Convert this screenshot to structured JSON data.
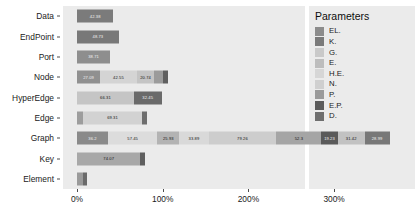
{
  "chart_data": {
    "type": "bar",
    "orientation": "horizontal",
    "stacked": true,
    "title": "",
    "xlabel": "",
    "ylabel": "",
    "xlim": [
      0,
      360
    ],
    "xticks": [
      0,
      100,
      200,
      300
    ],
    "xtick_labels": [
      "0%",
      "100%",
      "200%",
      "300%"
    ],
    "grid": false,
    "legend_position": "right",
    "legend_title": "Parameters",
    "categories": [
      "Data",
      "EndPoint",
      "Port",
      "Node",
      "HyperEdge",
      "Edge",
      "Graph",
      "Key",
      "Element"
    ],
    "series": [
      {
        "name": "EL.",
        "color": "#8c8c8c"
      },
      {
        "name": "K.",
        "color": "#7a7a7a"
      },
      {
        "name": "G.",
        "color": "#c9c9c9"
      },
      {
        "name": "E.",
        "color": "#bdbdbd"
      },
      {
        "name": "H.E.",
        "color": "#d6d6d6"
      },
      {
        "name": "N.",
        "color": "#cfcfcf"
      },
      {
        "name": "P.",
        "color": "#9a9a9a"
      },
      {
        "name": "E.P.",
        "color": "#5c5c5c"
      },
      {
        "name": "D.",
        "color": "#6e6e6e"
      }
    ],
    "rows": [
      {
        "category": "Data",
        "segments": [
          {
            "series": "K.",
            "value": 42.38,
            "label": "42.38",
            "color": "#7b7b7b",
            "label_color": "light"
          }
        ]
      },
      {
        "category": "EndPoint",
        "segments": [
          {
            "series": "K.",
            "value": 48.73,
            "label": "48.73",
            "color": "#787878",
            "label_color": "light"
          }
        ]
      },
      {
        "category": "Port",
        "segments": [
          {
            "series": "P.",
            "value": 38.71,
            "label": "38.71",
            "color": "#8e8e8e",
            "label_color": "light"
          }
        ]
      },
      {
        "category": "Node",
        "segments": [
          {
            "series": "EL.",
            "value": 27.09,
            "label": "27.09",
            "color": "#909090",
            "label_color": "light"
          },
          {
            "series": "H.E.",
            "value": 42.55,
            "label": "42.55",
            "color": "#d4d4d4",
            "label_color": "dark"
          },
          {
            "series": "N.",
            "value": 20.74,
            "label": "20.74",
            "color": "#c4c4c4",
            "label_color": "dark"
          },
          {
            "series": "P.",
            "value": 10.2,
            "label": "",
            "color": "#9b9b9b",
            "label_color": "light"
          },
          {
            "series": "E.P.",
            "value": 5.4,
            "label": "",
            "color": "#5f5f5f",
            "label_color": "light"
          }
        ]
      },
      {
        "category": "HyperEdge",
        "segments": [
          {
            "series": "H.E.",
            "value": 66.31,
            "label": "66.31",
            "color": "#c5c5c5",
            "label_color": "dark"
          },
          {
            "series": "E.P.",
            "value": 32.45,
            "label": "32.45",
            "color": "#6a6a6a",
            "label_color": "light"
          }
        ]
      },
      {
        "category": "Edge",
        "segments": [
          {
            "series": "EL.",
            "value": 6.8,
            "label": "",
            "color": "#9d9d9d",
            "label_color": "light"
          },
          {
            "series": "E.",
            "value": 69.31,
            "label": "69.31",
            "color": "#d2d2d2",
            "label_color": "dark"
          },
          {
            "series": "E.P.",
            "value": 5.6,
            "label": "",
            "color": "#6e6e6e",
            "label_color": "light"
          }
        ]
      },
      {
        "category": "Graph",
        "segments": [
          {
            "series": "EL.",
            "value": 36.2,
            "label": "36.2",
            "color": "#8a8a8a",
            "label_color": "light"
          },
          {
            "series": "G.",
            "value": 57.45,
            "label": "57.45",
            "color": "#dcdcdc",
            "label_color": "dark"
          },
          {
            "series": "E.",
            "value": 25.93,
            "label": "25.93",
            "color": "#b3b3b3",
            "label_color": "dark"
          },
          {
            "series": "H.E.",
            "value": 33.89,
            "label": "33.89",
            "color": "#d9d9d9",
            "label_color": "dark"
          },
          {
            "series": "N.",
            "value": 79.26,
            "label": "79.26",
            "color": "#cdcdcd",
            "label_color": "dark"
          },
          {
            "series": "P.",
            "value": 52.3,
            "label": "52.3",
            "color": "#a5a5a5",
            "label_color": "dark"
          },
          {
            "series": "E.P.",
            "value": 19.23,
            "label": "19.23",
            "color": "#5a5a5a",
            "label_color": "light"
          },
          {
            "series": "D.",
            "value": 31.42,
            "label": "31.42",
            "color": "#c2c2c2",
            "label_color": "dark"
          },
          {
            "series": "K.",
            "value": 28.99,
            "label": "28.99",
            "color": "#787878",
            "label_color": "light"
          }
        ]
      },
      {
        "category": "Key",
        "segments": [
          {
            "series": "K.",
            "value": 74.07,
            "label": "74.07",
            "color": "#a8a8a8",
            "label_color": "dark"
          },
          {
            "series": "E.P.",
            "value": 5.6,
            "label": "",
            "color": "#5f5f5f",
            "label_color": "light"
          }
        ]
      },
      {
        "category": "Element",
        "segments": [
          {
            "series": "EL.",
            "value": 7.2,
            "label": "",
            "color": "#9a9a9a",
            "label_color": "light"
          },
          {
            "series": "D.",
            "value": 4.0,
            "label": "",
            "color": "#6b6b6b",
            "label_color": "light"
          }
        ]
      }
    ]
  },
  "legend": {
    "title": "Parameters",
    "items": [
      {
        "label": "EL.",
        "color": "#8c8c8c"
      },
      {
        "label": "K.",
        "color": "#7a7a7a"
      },
      {
        "label": "G.",
        "color": "#c9c9c9"
      },
      {
        "label": "E.",
        "color": "#bdbdbd"
      },
      {
        "label": "H.E.",
        "color": "#d6d6d6"
      },
      {
        "label": "N.",
        "color": "#cfcfcf"
      },
      {
        "label": "P.",
        "color": "#9a9a9a"
      },
      {
        "label": "E.P.",
        "color": "#5c5c5c"
      },
      {
        "label": "D.",
        "color": "#6e6e6e"
      }
    ]
  }
}
